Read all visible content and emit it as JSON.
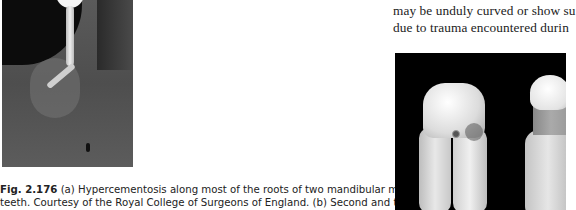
{
  "figure_left": {
    "alt": "Radiograph of root-filled mandibular molar root with hypercementosis"
  },
  "caption": {
    "label": "Fig. 2.176",
    "line1_rest": " (a) Hypercementosis along most of the roots of two mandibular molar",
    "line2": "teeth. Courtesy of the Royal College of Surgeons of England. (b) Second and third"
  },
  "body_text": {
    "line1": "may be unduly curved or show su",
    "line2": "due to trauma encountered durin"
  },
  "figure_right": {
    "alt": "Photograph of extracted molar teeth with hypercementosis on black background"
  }
}
